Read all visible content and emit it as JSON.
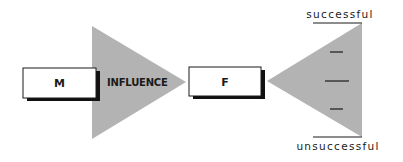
{
  "diagram": {
    "source_box": {
      "label": "M"
    },
    "arrow": {
      "label": "INFLUENCE"
    },
    "target_box": {
      "label": "F"
    },
    "outcome_scale": {
      "top_label": "successful",
      "bottom_label": "unsuccessful",
      "tick_count": 3
    }
  },
  "colors": {
    "triangle_fill": "#b3b3b3",
    "box_fill": "#ffffff",
    "box_border": "#1a1a1a",
    "shadow": "#111111",
    "text": "#1a1a1a"
  }
}
